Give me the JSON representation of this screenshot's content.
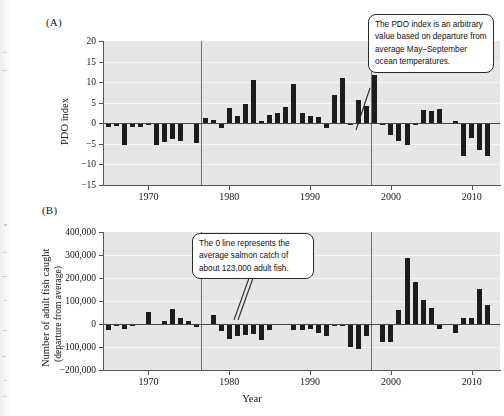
{
  "figure": {
    "panel_a_tag": "(A)",
    "panel_b_tag": "(B)",
    "xlabel": "Year"
  },
  "panel_a": {
    "ylabel": "PDO index",
    "ytick_labels": [
      "20",
      "15",
      "10",
      "5",
      "0",
      "−5",
      "−10",
      "−15"
    ],
    "xtick_labels": [
      "1970",
      "1980",
      "1990",
      "2000",
      "2010"
    ],
    "callout": "The PDO index is an arbitrary value based on departure from average May–September ocean temperatures."
  },
  "panel_b": {
    "ylabel_line1": "Number of adult fish caught",
    "ylabel_line2": "(departure from average)",
    "ytick_labels": [
      "400,000",
      "300,000",
      "200,000",
      "100,000",
      "0",
      "−100,000",
      "−200,000"
    ],
    "xtick_labels": [
      "1970",
      "1980",
      "1990",
      "2000",
      "2010"
    ],
    "callout": "The 0 line represents the average salmon catch of about 123,000 adult fish."
  },
  "chart_data": [
    {
      "type": "bar",
      "title": "(A) PDO index",
      "xlabel": "Year",
      "ylabel": "PDO index",
      "xlim": [
        1964.5,
        2013.5
      ],
      "ylim": [
        -15,
        20
      ],
      "ytick_values": [
        20,
        15,
        10,
        5,
        0,
        -5,
        -10,
        -15
      ],
      "xtick_values": [
        1970,
        1980,
        1990,
        2000,
        2010
      ],
      "grid": true,
      "legend": "none",
      "annotations": [
        {
          "text": "The PDO index is an arbitrary value based on departure from average May–September ocean temperatures.",
          "points_to_year": 2002
        },
        {
          "type": "vline",
          "x": 1976.5,
          "label": "regime shift"
        },
        {
          "type": "vline",
          "x": 1997.5,
          "label": "regime shift"
        }
      ],
      "x": [
        1965,
        1966,
        1967,
        1968,
        1969,
        1970,
        1971,
        1972,
        1973,
        1974,
        1975,
        1976,
        1977,
        1978,
        1979,
        1980,
        1981,
        1982,
        1983,
        1984,
        1985,
        1986,
        1987,
        1988,
        1989,
        1990,
        1991,
        1992,
        1993,
        1994,
        1995,
        1996,
        1997,
        1998,
        1999,
        2000,
        2001,
        2002,
        2003,
        2004,
        2005,
        2006,
        2007,
        2008,
        2009,
        2010,
        2011,
        2012
      ],
      "values": [
        -0.9,
        -0.7,
        -5.4,
        -0.9,
        -0.8,
        -0.3,
        -5.3,
        -4.6,
        -3.7,
        -4.2,
        -0.2,
        -4.9,
        1.3,
        0.9,
        -1.1,
        3.6,
        1.7,
        4.7,
        10.5,
        0.5,
        2.0,
        2.4,
        3.9,
        9.6,
        2.5,
        1.7,
        1.6,
        -1.2,
        6.9,
        10.9,
        -0.4,
        5.7,
        4.1,
        11.8,
        -0.5,
        -2.8,
        -4.4,
        -5.2,
        -0.3,
        3.2,
        3.1,
        3.4,
        0.1,
        0.6,
        -8.0,
        -3.6,
        -6.6,
        -7.9
      ]
    },
    {
      "type": "bar",
      "title": "(B) Number of adult fish caught (departure from average)",
      "xlabel": "Year",
      "ylabel": "Number of adult fish caught (departure from average)",
      "xlim": [
        1964.5,
        2013.5
      ],
      "ylim": [
        -200000,
        400000
      ],
      "ytick_values": [
        400000,
        300000,
        200000,
        100000,
        0,
        -100000,
        -200000
      ],
      "xtick_values": [
        1970,
        1980,
        1990,
        2000,
        2010
      ],
      "grid": true,
      "legend": "none",
      "annotations": [
        {
          "text": "The 0 line represents the average salmon catch of about 123,000 adult fish.",
          "points_to_year": 1986
        },
        {
          "type": "vline",
          "x": 1976.5,
          "label": "regime shift"
        },
        {
          "type": "vline",
          "x": 1997.5,
          "label": "regime shift"
        }
      ],
      "x": [
        1965,
        1966,
        1967,
        1968,
        1969,
        1970,
        1971,
        1972,
        1973,
        1974,
        1975,
        1976,
        1977,
        1978,
        1979,
        1980,
        1981,
        1982,
        1983,
        1984,
        1985,
        1986,
        1987,
        1988,
        1989,
        1990,
        1991,
        1992,
        1993,
        1994,
        1995,
        1996,
        1997,
        1998,
        1999,
        2000,
        2001,
        2002,
        2003,
        2004,
        2005,
        2006,
        2007,
        2008,
        2009,
        2010,
        2011,
        2012
      ],
      "values": [
        -27000,
        -8000,
        -22000,
        -9000,
        -6000,
        54000,
        2000,
        15000,
        66000,
        28000,
        14000,
        -11000,
        -3000,
        39000,
        -31000,
        -66000,
        -54000,
        -48000,
        -42000,
        -68000,
        -27000,
        -4000,
        -3000,
        -26000,
        -27000,
        -22000,
        -38000,
        -53000,
        -9000,
        -8000,
        -98000,
        -110000,
        -52000,
        -3000,
        -80000,
        -78000,
        63000,
        289000,
        183000,
        103000,
        70000,
        -22000,
        -3000,
        -40000,
        28000,
        24000,
        152000,
        84000,
        63000
      ]
    }
  ]
}
